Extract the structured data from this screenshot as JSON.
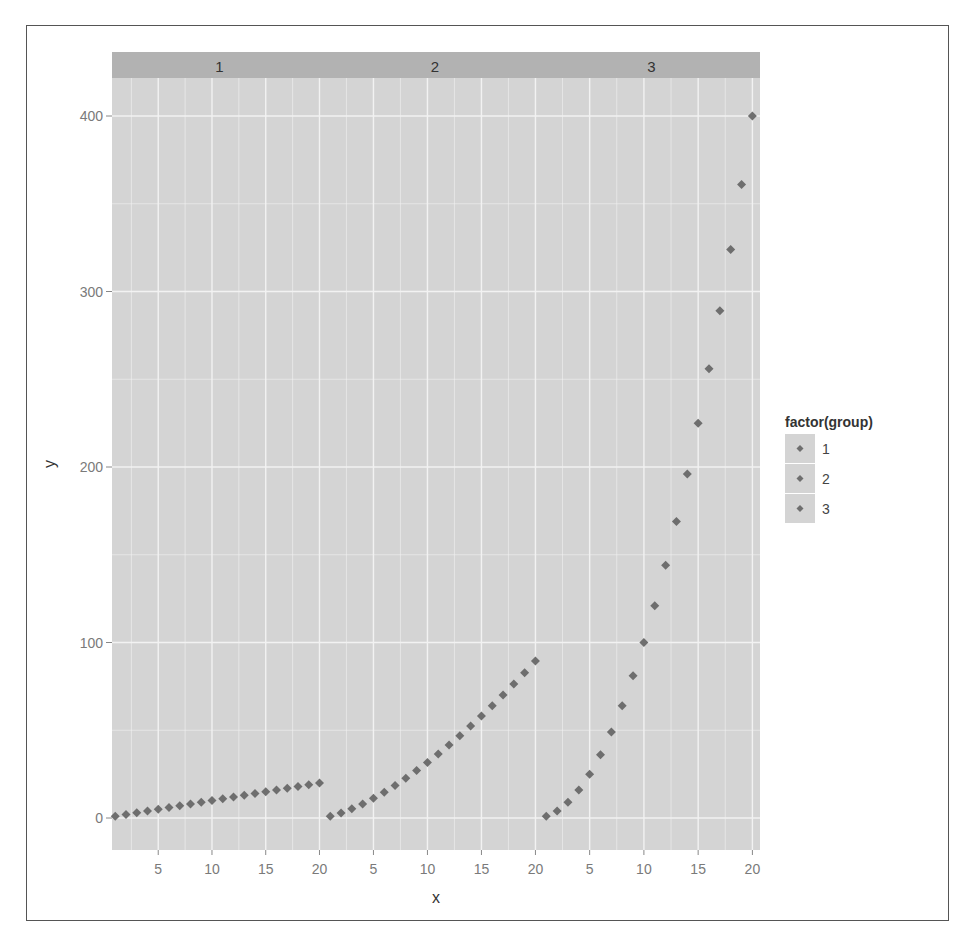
{
  "chart_data": {
    "type": "scatter",
    "facet_by": "group",
    "panels": [
      "1",
      "2",
      "3"
    ],
    "x": [
      1,
      2,
      3,
      4,
      5,
      6,
      7,
      8,
      9,
      10,
      11,
      12,
      13,
      14,
      15,
      16,
      17,
      18,
      19,
      20
    ],
    "series": [
      {
        "name": "1",
        "formula": "y = x",
        "values": [
          1,
          2,
          3,
          4,
          5,
          6,
          7,
          8,
          9,
          10,
          11,
          12,
          13,
          14,
          15,
          16,
          17,
          18,
          19,
          20
        ]
      },
      {
        "name": "2",
        "formula": "y = x^1.5",
        "values": [
          1,
          2.8,
          5.2,
          8,
          11.2,
          14.7,
          18.5,
          22.6,
          27,
          31.6,
          36.5,
          41.6,
          46.9,
          52.4,
          58.1,
          64,
          70.1,
          76.4,
          82.8,
          89.4
        ]
      },
      {
        "name": "3",
        "formula": "y = x^2",
        "values": [
          1,
          4,
          9,
          16,
          25,
          36,
          49,
          64,
          81,
          100,
          121,
          144,
          169,
          196,
          225,
          256,
          289,
          324,
          361,
          400
        ]
      }
    ],
    "title": "",
    "xlabel": "x",
    "ylabel": "y",
    "x_ticks": [
      "5",
      "10",
      "15",
      "20"
    ],
    "y_ticks": [
      "0",
      "100",
      "200",
      "300",
      "400"
    ],
    "ylim": [
      -18,
      418
    ],
    "xlim": [
      0.7,
      20.7
    ],
    "grid": true,
    "legend": {
      "title": "factor(group)",
      "position": "right",
      "entries": [
        "1",
        "2",
        "3"
      ]
    },
    "colors": {
      "panel_bg": "#d4d4d4",
      "strip_bg": "#b2b2b2",
      "grid": "#f2f2f2",
      "point": "#6e6e6e",
      "text": "#7a7a7a"
    }
  },
  "strip_labels": [
    "1",
    "2",
    "3"
  ],
  "axes": {
    "xlabel": "x",
    "ylabel": "y",
    "y_ticks": [
      "0",
      "100",
      "200",
      "300",
      "400"
    ],
    "x_ticks": [
      "5",
      "10",
      "15",
      "20"
    ]
  },
  "legend": {
    "title": "factor(group)",
    "items": [
      "1",
      "2",
      "3"
    ]
  }
}
